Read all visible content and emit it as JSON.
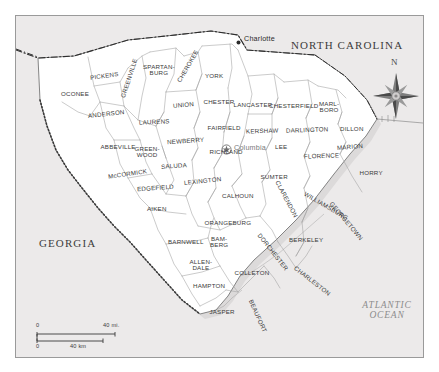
{
  "map": {
    "title": "South Carolina counties map",
    "background_color": "#eceaea",
    "land_color": "#ffffff",
    "border_color": "#9a9a9a",
    "state_labels": [
      {
        "name": "north-carolina",
        "text": "NORTH CAROLINA",
        "x": 288,
        "y": 38
      },
      {
        "name": "georgia",
        "text": "GEORGIA",
        "x": 33,
        "y": 237
      }
    ],
    "ocean_label": {
      "name": "atlantic-ocean",
      "line1": "ATLANTIC",
      "line2": "OCEAN",
      "x": 352,
      "y": 305
    },
    "cities": [
      {
        "name": "charlotte",
        "text": "Charlotte",
        "x": 225,
        "y": 25,
        "marker": "dot",
        "marker_x": 221,
        "marker_y": 30
      },
      {
        "name": "columbia",
        "text": "Columbia",
        "x": 216,
        "y": 147,
        "marker": "capital-star",
        "marker_x": 208,
        "marker_y": 150
      }
    ],
    "counties": [
      {
        "name": "oconee",
        "label": "OCONEE",
        "x": 59,
        "y": 78,
        "rot": 0
      },
      {
        "name": "pickens",
        "label": "PICKENS",
        "x": 88,
        "y": 60,
        "rot": -8
      },
      {
        "name": "greenville",
        "label": "GREENVILLE",
        "x": 113,
        "y": 62,
        "rot": -72
      },
      {
        "name": "spartanburg",
        "label": "SPARTAN-\nBURG",
        "x": 143,
        "y": 54,
        "rot": 0
      },
      {
        "name": "cherokee",
        "label": "CHEROKEE",
        "x": 172,
        "y": 50,
        "rot": -60
      },
      {
        "name": "york",
        "label": "YORK",
        "x": 198,
        "y": 60,
        "rot": 0
      },
      {
        "name": "union",
        "label": "UNION",
        "x": 167,
        "y": 89,
        "rot": -6
      },
      {
        "name": "chester",
        "label": "CHESTER",
        "x": 203,
        "y": 86,
        "rot": 0
      },
      {
        "name": "lancaster",
        "label": "LANCASTER",
        "x": 237,
        "y": 89,
        "rot": 0
      },
      {
        "name": "chesterfield",
        "label": "CHESTERFIELD",
        "x": 278,
        "y": 90,
        "rot": 0
      },
      {
        "name": "marlboro",
        "label": "MARL-\nBORO",
        "x": 313,
        "y": 91,
        "rot": 0
      },
      {
        "name": "dillon",
        "label": "DILLON",
        "x": 336,
        "y": 113,
        "rot": 0
      },
      {
        "name": "marion",
        "label": "MARION",
        "x": 334,
        "y": 131,
        "rot": -5
      },
      {
        "name": "horry",
        "label": "HORRY",
        "x": 355,
        "y": 157,
        "rot": 0
      },
      {
        "name": "anderson",
        "label": "ANDERSON",
        "x": 90,
        "y": 98,
        "rot": -6
      },
      {
        "name": "laurens",
        "label": "LAURENS",
        "x": 138,
        "y": 106,
        "rot": -2
      },
      {
        "name": "newberry",
        "label": "NEWBERRY",
        "x": 169,
        "y": 125,
        "rot": -4
      },
      {
        "name": "fairfield",
        "label": "FAIRFIELD",
        "x": 208,
        "y": 112,
        "rot": 0
      },
      {
        "name": "kershaw",
        "label": "KERSHAW",
        "x": 246,
        "y": 115,
        "rot": -2
      },
      {
        "name": "darlington",
        "label": "DARLINGTON",
        "x": 291,
        "y": 114,
        "rot": -2
      },
      {
        "name": "lee",
        "label": "LEE",
        "x": 265,
        "y": 131,
        "rot": 0
      },
      {
        "name": "florence",
        "label": "FLORENCE",
        "x": 305,
        "y": 140,
        "rot": -2
      },
      {
        "name": "abbeville",
        "label": "ABBEVILLE",
        "x": 102,
        "y": 131,
        "rot": 0
      },
      {
        "name": "greenwood",
        "label": "GREEN-\nWOOD",
        "x": 131,
        "y": 136,
        "rot": 0
      },
      {
        "name": "saluda",
        "label": "SALUDA",
        "x": 158,
        "y": 150,
        "rot": -4
      },
      {
        "name": "richland",
        "label": "RICHLAND",
        "x": 210,
        "y": 136,
        "rot": 0
      },
      {
        "name": "lexington",
        "label": "LEXINGTON",
        "x": 186,
        "y": 165,
        "rot": -6
      },
      {
        "name": "mccormick",
        "label": "McCORMICK",
        "x": 111,
        "y": 158,
        "rot": -8
      },
      {
        "name": "edgefield",
        "label": "EDGEFIELD",
        "x": 139,
        "y": 172,
        "rot": -4
      },
      {
        "name": "aiken",
        "label": "AIKEN",
        "x": 141,
        "y": 193,
        "rot": 0
      },
      {
        "name": "calhoun",
        "label": "CALHOUN",
        "x": 222,
        "y": 180,
        "rot": 0
      },
      {
        "name": "sumter",
        "label": "SUMTER",
        "x": 258,
        "y": 161,
        "rot": 0
      },
      {
        "name": "clarendon",
        "label": "CLARENDON",
        "x": 270,
        "y": 183,
        "rot": 62
      },
      {
        "name": "williamsburg",
        "label": "WILLIAMSBURG",
        "x": 310,
        "y": 190,
        "rot": 30
      },
      {
        "name": "georgetown",
        "label": "GEORGETOWN",
        "x": 330,
        "y": 205,
        "rot": 50
      },
      {
        "name": "orangeburg",
        "label": "ORANGEBURG",
        "x": 212,
        "y": 207,
        "rot": 0
      },
      {
        "name": "berkeley",
        "label": "BERKELEY",
        "x": 290,
        "y": 224,
        "rot": 0
      },
      {
        "name": "barnwell",
        "label": "BARNWELL",
        "x": 170,
        "y": 226,
        "rot": 0
      },
      {
        "name": "bamberg",
        "label": "BAM-\nBERG",
        "x": 203,
        "y": 226,
        "rot": 0
      },
      {
        "name": "dorchester",
        "label": "DORCHESTER",
        "x": 256,
        "y": 236,
        "rot": 52
      },
      {
        "name": "allendale",
        "label": "ALLEN-\nDALE",
        "x": 185,
        "y": 249,
        "rot": 0
      },
      {
        "name": "colleton",
        "label": "COLLETON",
        "x": 236,
        "y": 257,
        "rot": 0
      },
      {
        "name": "hampton",
        "label": "HAMPTON",
        "x": 193,
        "y": 270,
        "rot": 0
      },
      {
        "name": "charleston",
        "label": "CHARLESTON",
        "x": 296,
        "y": 265,
        "rot": 38
      },
      {
        "name": "jasper",
        "label": "JASPER",
        "x": 206,
        "y": 296,
        "rot": 0
      },
      {
        "name": "beaufort",
        "label": "BEAUFORT",
        "x": 241,
        "y": 300,
        "rot": 66
      }
    ],
    "compass": {
      "name": "compass-rose",
      "north_letter": "N"
    },
    "scale": {
      "name": "scale-bar",
      "miles_zero": "0",
      "miles_max": "40 mi.",
      "km_zero": "0",
      "km_max": "40 km"
    }
  }
}
